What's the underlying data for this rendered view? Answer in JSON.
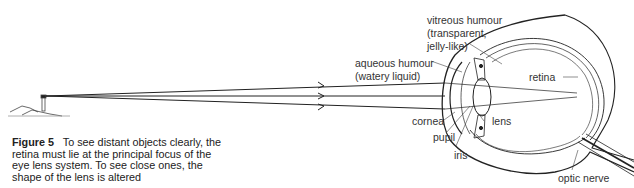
{
  "caption": {
    "figure_label": "Figure 5",
    "text": "To see distant objects clearly, the retina must lie at the principal focus of the eye lens system. To see close ones, the shape of the lens is altered"
  },
  "labels": {
    "vitreous_1": "vitreous humour",
    "vitreous_2": "(transparent,",
    "vitreous_3": "jelly-like)",
    "aqueous_1": "aqueous humour",
    "aqueous_2": "(watery liquid)",
    "retina": "retina",
    "cornea": "cornea",
    "pupil": "pupil",
    "iris": "iris",
    "lens": "lens",
    "optic_nerve": "optic nerve"
  },
  "colors": {
    "line": "#2a2a2a",
    "background": "#ffffff"
  }
}
